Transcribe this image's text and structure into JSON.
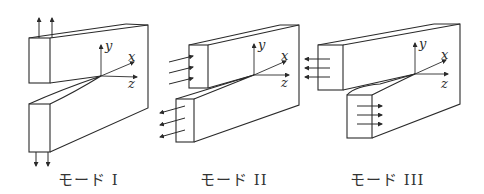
{
  "figure": {
    "colors": {
      "stroke": "#2a2a2a",
      "background": "#ffffff",
      "label": "#333333"
    },
    "axes": {
      "x": "x",
      "y": "y",
      "z": "z"
    },
    "modes": [
      {
        "id": "mode-1",
        "label": "モード I",
        "load": "opening (tensile, ±y)"
      },
      {
        "id": "mode-2",
        "label": "モード II",
        "load": "in-plane shear (sliding, ±x)"
      },
      {
        "id": "mode-3",
        "label": "モード III",
        "load": "out-of-plane shear (tearing, ±z)"
      }
    ]
  }
}
